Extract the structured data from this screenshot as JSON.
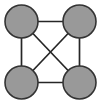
{
  "figure": {
    "title": "",
    "background_color": "#ffffff",
    "width": 101,
    "height": 107
  },
  "graph": {
    "name": "complete-graph-k4",
    "description": "Complete graph on four vertices",
    "node_count": 4,
    "edge_count": 6,
    "node_fill_color": "#999999",
    "node_stroke_color": "#333333",
    "node_stroke_width": 1.6,
    "node_radius": 16.5,
    "edge_color": "#262626",
    "edge_width": 1.7,
    "nodes": [
      {
        "id": "top-left",
        "label": "",
        "cx": 21.5,
        "cy": 21.5
      },
      {
        "id": "top-right",
        "label": "",
        "cx": 79.5,
        "cy": 21.5
      },
      {
        "id": "bottom-left",
        "label": "",
        "cx": 21.5,
        "cy": 82.5
      },
      {
        "id": "bottom-right",
        "label": "",
        "cx": 79.5,
        "cy": 82.5
      }
    ],
    "edges": [
      {
        "id": "edge-top",
        "from": "top-left",
        "to": "top-right",
        "x1": 21.5,
        "y1": 21.5,
        "x2": 79.5,
        "y2": 21.5
      },
      {
        "id": "edge-left",
        "from": "top-left",
        "to": "bottom-left",
        "x1": 21.5,
        "y1": 21.5,
        "x2": 21.5,
        "y2": 82.5
      },
      {
        "id": "edge-right",
        "from": "top-right",
        "to": "bottom-right",
        "x1": 79.5,
        "y1": 21.5,
        "x2": 79.5,
        "y2": 82.5
      },
      {
        "id": "edge-bottom",
        "from": "bottom-left",
        "to": "bottom-right",
        "x1": 21.5,
        "y1": 82.5,
        "x2": 79.5,
        "y2": 82.5
      },
      {
        "id": "edge-diagonal-main",
        "from": "top-left",
        "to": "bottom-right",
        "x1": 21.5,
        "y1": 21.5,
        "x2": 79.5,
        "y2": 82.5
      },
      {
        "id": "edge-diagonal-anti",
        "from": "top-right",
        "to": "bottom-left",
        "x1": 79.5,
        "y1": 21.5,
        "x2": 21.5,
        "y2": 82.5
      }
    ]
  }
}
